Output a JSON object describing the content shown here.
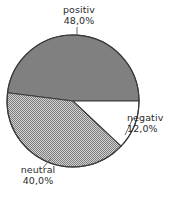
{
  "chart_data": {
    "type": "pie",
    "title": "",
    "subtitle": "",
    "xlabel": "",
    "ylabel": "",
    "grid": false,
    "legend_position": "none",
    "label_format": "name above percentage, German decimal comma",
    "categories": [
      "positiv",
      "neutral",
      "negativ"
    ],
    "values": [
      48.0,
      40.0,
      12.0
    ],
    "slices": [
      {
        "label": "positiv",
        "value": 48.0,
        "value_text": "48,0%",
        "fill": "#808080",
        "fill_style": "solid-gray",
        "start_angle_deg": 0,
        "end_angle_deg": 172.8,
        "direction": "counterclockwise"
      },
      {
        "label": "neutral",
        "value": 40.0,
        "value_text": "40,0%",
        "fill": "#a9a9a9",
        "fill_style": "checkered-dither",
        "start_angle_deg": 172.8,
        "end_angle_deg": 316.8,
        "direction": "counterclockwise"
      },
      {
        "label": "negativ",
        "value": 12.0,
        "value_text": "12,0%",
        "fill": "#ffffff",
        "fill_style": "white",
        "start_angle_deg": 316.8,
        "end_angle_deg": 360,
        "direction": "counterclockwise"
      }
    ]
  },
  "labels": {
    "positiv": {
      "name": "positiv",
      "percent": "48,0%"
    },
    "neutral": {
      "name": "neutral",
      "percent": "40,0%"
    },
    "negativ": {
      "name": "negativ",
      "percent": "12,0%"
    }
  },
  "colors": {
    "background": "#ffffff",
    "outline": "#3a3a3a",
    "text": "#2b2b2b",
    "positiv_fill": "#808080",
    "neutral_fill": "#a9a9a9",
    "negativ_fill": "#ffffff",
    "leader_line": "#5a5a5a"
  }
}
